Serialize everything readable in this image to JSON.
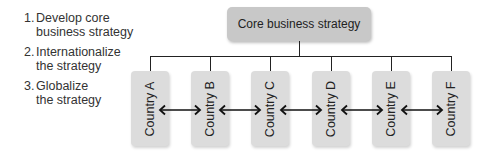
{
  "steps": [
    {
      "num": "1.",
      "text": "Develop core\nbusiness strategy"
    },
    {
      "num": "2.",
      "text": "Internationalize\nthe strategy"
    },
    {
      "num": "3.",
      "text": "Globalize\nthe strategy"
    }
  ],
  "core": {
    "label": "Core business strategy"
  },
  "countries": [
    {
      "label": "Country A"
    },
    {
      "label": "Country B"
    },
    {
      "label": "Country C"
    },
    {
      "label": "Country D"
    },
    {
      "label": "Country E"
    },
    {
      "label": "Country F"
    }
  ],
  "colors": {
    "core_box": "#c8c8c8",
    "country_box": "#dcdcdc",
    "line": "#222222"
  }
}
